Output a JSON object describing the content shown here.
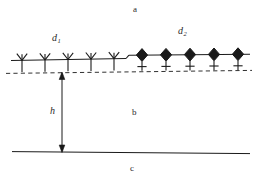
{
  "figure": {
    "background_color": "#ffffff",
    "line_color": "#1a1a1a",
    "labels": {
      "a": "a",
      "b": "b",
      "c": "c",
      "h": "h",
      "d1_base": "d",
      "d1_sub": "1",
      "d2_base": "d",
      "d2_sub": "2"
    },
    "geometry": {
      "solid_line_left_x": 11,
      "solid_line_right_x": 250,
      "solid_line_left_y": 60,
      "solid_line_right_y": 55,
      "step_x": 126,
      "dashed_line_y": 72,
      "bottom_line_y": 152,
      "bottom_line_left_x": 12,
      "bottom_line_right_x": 250,
      "arrow_x": 62,
      "arrow_top_y": 72,
      "arrow_bottom_y": 152
    },
    "receptors": {
      "y_shape_label": "antibody-Y-receptor",
      "y_shape_count": 5,
      "y_shape_x_positions": [
        22,
        45,
        68,
        91,
        114
      ],
      "diamond_label": "diamond-receptor",
      "diamond_count": 5,
      "diamond_x_positions": [
        142,
        166,
        190,
        214,
        238
      ]
    }
  }
}
